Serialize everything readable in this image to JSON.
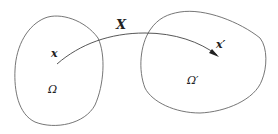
{
  "diagram": {
    "map_label": "X",
    "source_point_label": "x",
    "target_point_label": "x′",
    "source_domain_label": "Ω",
    "target_domain_label": "Ω′"
  },
  "colors": {
    "stroke": "#555555",
    "text": "#222222"
  }
}
